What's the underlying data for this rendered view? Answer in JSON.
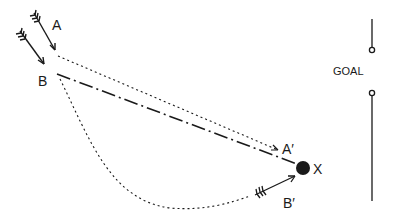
{
  "diagram": {
    "title": "",
    "colors": {
      "ink": "#1a1a1a",
      "background": "#ffffff"
    },
    "labels": {
      "a": "A",
      "b": "B",
      "a_prime": "A′",
      "b_prime": "B′",
      "x": "X",
      "goal": "GOAL"
    },
    "elements": [
      {
        "id": "arrow-a",
        "type": "arrow",
        "label": "A"
      },
      {
        "id": "arrow-b",
        "type": "arrow",
        "label": "B"
      },
      {
        "id": "path-a-to-a-prime",
        "type": "dotted-line",
        "from": "A",
        "to": "A′"
      },
      {
        "id": "path-b-to-x",
        "type": "dash-dot-line",
        "from": "B",
        "to": "X"
      },
      {
        "id": "path-b-to-b-prime",
        "type": "dotted-curve",
        "from": "B",
        "to": "B′"
      },
      {
        "id": "ball-x",
        "type": "ball",
        "label": "X"
      },
      {
        "id": "goal-posts",
        "type": "goal",
        "label": "GOAL"
      }
    ]
  }
}
